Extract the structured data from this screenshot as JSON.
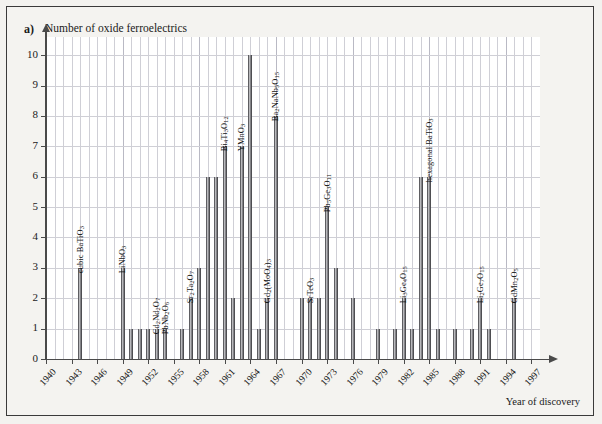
{
  "figure": {
    "panel_label": "a)",
    "background_color": "#f3f2ef",
    "bar_color": "#8e8e92"
  },
  "chart_data": {
    "type": "bar",
    "title": "Number of oxide ferroelectrics",
    "xlabel": "Year of discovery",
    "ylabel": "Number of oxide ferroelectrics",
    "xlim": [
      1940,
      1998
    ],
    "ylim": [
      0,
      10.6
    ],
    "yticks": [
      0,
      1,
      2,
      3,
      4,
      5,
      6,
      7,
      8,
      9,
      10
    ],
    "xticks": [
      1940,
      1943,
      1946,
      1949,
      1952,
      1955,
      1958,
      1961,
      1964,
      1967,
      1970,
      1973,
      1976,
      1979,
      1982,
      1985,
      1988,
      1991,
      1994,
      1997
    ],
    "grid": true,
    "legend": "none",
    "x": [
      1944,
      1949,
      1950,
      1951,
      1952,
      1953,
      1954,
      1956,
      1957,
      1958,
      1959,
      1960,
      1961,
      1962,
      1963,
      1964,
      1965,
      1966,
      1967,
      1970,
      1971,
      1972,
      1973,
      1974,
      1976,
      1979,
      1981,
      1982,
      1983,
      1984,
      1985,
      1986,
      1988,
      1990,
      1991,
      1992,
      1995
    ],
    "values": [
      3,
      3,
      1,
      1,
      1,
      1,
      1,
      1,
      2,
      3,
      6,
      6,
      7,
      2,
      7,
      10,
      1,
      2,
      8,
      2,
      2,
      2,
      5,
      3,
      2,
      1,
      1,
      2,
      1,
      6,
      6,
      1,
      1,
      1,
      2,
      1,
      2
    ],
    "annotations": [
      {
        "year": 1944,
        "text": "cubic BaTiO3",
        "html": "cubic BaTiO<sub>3</sub>"
      },
      {
        "year": 1949,
        "text": "LiNbO3",
        "html": "LiNbO<sub>3</sub>"
      },
      {
        "year": 1953,
        "text": "Cd2Nd2O7",
        "html": "Cd<sub>2</sub>Nd<sub>2</sub>O<sub>7</sub>"
      },
      {
        "year": 1954,
        "text": "PbNb2O6",
        "html": "PbNb<sub>2</sub>O<sub>6</sub>"
      },
      {
        "year": 1957,
        "text": "Sr2Ta2O7",
        "html": "Sr<sub>2</sub>Ta<sub>2</sub>O<sub>7</sub>"
      },
      {
        "year": 1961,
        "text": "Bi4Ti3O12",
        "html": "Bi<sub>4</sub>Ti<sub>3</sub>O<sub>12</sub>"
      },
      {
        "year": 1963,
        "text": "YMnO3",
        "html": "YMnO<sub>3</sub>"
      },
      {
        "year": 1966,
        "text": "Gd2(MoO4)3",
        "html": "Gd<sub>2</sub>(MoO<sub>4</sub>)<sub>3</sub>"
      },
      {
        "year": 1967,
        "text": "Ba2NaNb5O15",
        "html": "Ba<sub>2</sub>NaNb<sub>5</sub>O<sub>15</sub>"
      },
      {
        "year": 1971,
        "text": "SrTeO3",
        "html": "SrTeO<sub>3</sub>"
      },
      {
        "year": 1973,
        "text": "Pb5Ge3O11",
        "html": "Pb<sub>5</sub>Ge<sub>3</sub>O<sub>11</sub>"
      },
      {
        "year": 1982,
        "text": "Li3Ge4O15",
        "html": "Li<sub>3</sub>Ge<sub>4</sub>O<sub>15</sub>"
      },
      {
        "year": 1985,
        "text": "hexagonal BaTiO3",
        "html": "hexagonal BaTiO<sub>3</sub>"
      },
      {
        "year": 1991,
        "text": "Li2Ge7O15",
        "html": "Li<sub>2</sub>Ge<sub>7</sub>O<sub>15</sub>"
      },
      {
        "year": 1995,
        "text": "GdMn2O5",
        "html": "GdMn<sub>2</sub>O<sub>5</sub>"
      }
    ]
  }
}
